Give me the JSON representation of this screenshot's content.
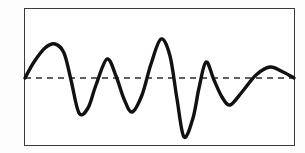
{
  "figure": {
    "background_color": "#fdfdfd",
    "plot_background_color": "#ffffff",
    "frame": {
      "x": 24,
      "y": 8,
      "width": 271,
      "height": 138,
      "stroke_color": "#3a3a3a",
      "stroke_width": 1.5
    }
  },
  "chart_data": {
    "type": "line",
    "title": "",
    "subtitle": "",
    "xlabel": "",
    "ylabel": "",
    "xlim": [
      0,
      100
    ],
    "ylim": [
      -1.1,
      1.1
    ],
    "grid": false,
    "legend": null,
    "axis_ticks": {
      "x": [],
      "y": []
    },
    "annotations": [],
    "series": [
      {
        "name": "waveform",
        "color": "#111111",
        "stroke_width": 3.4,
        "smooth": true,
        "x": [
          0,
          4,
          8,
          12,
          17,
          21,
          25,
          29,
          33,
          37,
          41,
          45,
          49,
          53,
          57,
          61,
          65,
          69,
          73,
          77,
          81,
          85,
          89,
          93,
          96,
          100
        ],
        "y": [
          0.0,
          0.22,
          0.45,
          0.49,
          0.33,
          -0.09,
          -0.43,
          -0.51,
          -0.31,
          0.05,
          0.25,
          0.22,
          -0.1,
          -0.43,
          -0.48,
          -0.2,
          0.28,
          0.63,
          0.58,
          0.1,
          -0.52,
          -0.86,
          -0.55,
          0.04,
          0.23,
          0.13
        ],
        "points_pixel": [
          {
            "x": 25,
            "y": 78,
            "kind": "start-baseline"
          },
          {
            "x": 34,
            "y": 62,
            "kind": "rise"
          },
          {
            "x": 45,
            "y": 48,
            "kind": "rise"
          },
          {
            "x": 55,
            "y": 44,
            "kind": "peak-1"
          },
          {
            "x": 64,
            "y": 53,
            "kind": "fall"
          },
          {
            "x": 71,
            "y": 80,
            "kind": "zero-crossing"
          },
          {
            "x": 79,
            "y": 113,
            "kind": "trough-1"
          },
          {
            "x": 88,
            "y": 108,
            "kind": "rise"
          },
          {
            "x": 96,
            "y": 85,
            "kind": "zero-crossing"
          },
          {
            "x": 107,
            "y": 59,
            "kind": "peak-2"
          },
          {
            "x": 116,
            "y": 76,
            "kind": "fall"
          },
          {
            "x": 124,
            "y": 99,
            "kind": "fall"
          },
          {
            "x": 132,
            "y": 112,
            "kind": "trough-2"
          },
          {
            "x": 142,
            "y": 95,
            "kind": "rise"
          },
          {
            "x": 151,
            "y": 64,
            "kind": "rise"
          },
          {
            "x": 161,
            "y": 39,
            "kind": "peak-3"
          },
          {
            "x": 170,
            "y": 56,
            "kind": "fall"
          },
          {
            "x": 177,
            "y": 99,
            "kind": "fall"
          },
          {
            "x": 184,
            "y": 137,
            "kind": "trough-3"
          },
          {
            "x": 193,
            "y": 118,
            "kind": "rise"
          },
          {
            "x": 199,
            "y": 88,
            "kind": "rise"
          },
          {
            "x": 206,
            "y": 62,
            "kind": "peak-4"
          },
          {
            "x": 214,
            "y": 80,
            "kind": "fall"
          },
          {
            "x": 222,
            "y": 97,
            "kind": "fall"
          },
          {
            "x": 230,
            "y": 105,
            "kind": "trough-4"
          },
          {
            "x": 242,
            "y": 92,
            "kind": "rise"
          },
          {
            "x": 256,
            "y": 75,
            "kind": "rise"
          },
          {
            "x": 270,
            "y": 67,
            "kind": "peak-5"
          },
          {
            "x": 283,
            "y": 72,
            "kind": "fall"
          },
          {
            "x": 294,
            "y": 78,
            "kind": "end-baseline"
          }
        ]
      }
    ],
    "reference_lines": [
      {
        "name": "zero-baseline",
        "orientation": "horizontal",
        "value": 0,
        "pixel_y": 78,
        "style": "dashed",
        "dash_pattern": "6,5",
        "color": "#2b2b2b",
        "stroke_width": 1.6
      }
    ]
  }
}
